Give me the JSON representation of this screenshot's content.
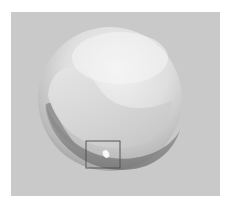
{
  "figure": {
    "background_color": "#c9c9c9",
    "sphere": {
      "cx": 110,
      "cy": 99,
      "r": 72
    },
    "inset_box": {
      "x": 86,
      "y": 141,
      "width": 34,
      "height": 27,
      "stroke": "#555555"
    },
    "highlight_spot": {
      "cx": 106,
      "cy": 154
    }
  }
}
